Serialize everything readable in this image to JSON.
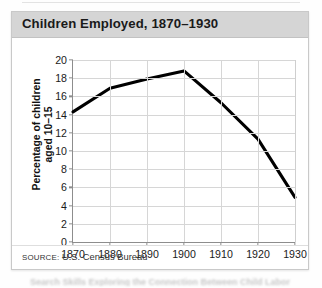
{
  "figure": {
    "title": "Children Employed, 1870–1930",
    "source": {
      "label": "SOURCE:",
      "text": "U.S. Census Bureau"
    },
    "caption_fragment": "Search Skills  Exploring the Connection Between Child Labor"
  },
  "colors": {
    "title_band": "#d5d5d5",
    "frame_border": "#c9c9c9",
    "gridline": "#d6d6d6",
    "axis": "#8d8d8d",
    "series_line": "#000000",
    "background": "#ffffff"
  },
  "chart_data": {
    "type": "line",
    "title": "Children Employed, 1870–1930",
    "xlabel": "",
    "ylabel": "Percentage of children aged 10–15",
    "ylabel_lines": [
      "Percentage of children",
      "aged 10–15"
    ],
    "x": [
      1870,
      1880,
      1890,
      1900,
      1910,
      1920,
      1930
    ],
    "values": [
      14.3,
      16.9,
      17.9,
      18.8,
      15.3,
      11.3,
      4.9
    ],
    "xticks": [
      "1870",
      "1880",
      "1890",
      "1900",
      "1910",
      "1920",
      "1930"
    ],
    "yticks": [
      "0",
      "2",
      "4",
      "6",
      "8",
      "10",
      "12",
      "14",
      "16",
      "18",
      "20"
    ],
    "xlim": [
      1870,
      1930
    ],
    "ylim": [
      0,
      20
    ],
    "grid": true,
    "legend": null,
    "legend_position": "none",
    "annotations": []
  }
}
